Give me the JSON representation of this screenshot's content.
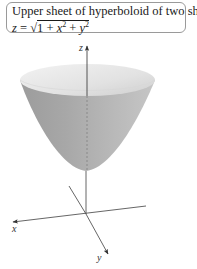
{
  "caption": {
    "title": "Upper sheet of hyperboloid of two sheets",
    "equation_lhs": "z",
    "equation_eq": " = ",
    "equation_sqrt": "√",
    "equation_radicand_parts": [
      "1",
      " + ",
      "x",
      "2",
      " + ",
      "y",
      "2"
    ]
  },
  "figure": {
    "surface": "upper-sheet-hyperboloid",
    "axes": {
      "x_label": "x",
      "y_label": "y",
      "z_label": "z"
    },
    "colors": {
      "axis": "#555555",
      "surface_light": "#e6e6e6",
      "surface_mid": "#b5b5b5",
      "surface_dark": "#8f8f8f",
      "border": "#9a9a9a"
    }
  }
}
